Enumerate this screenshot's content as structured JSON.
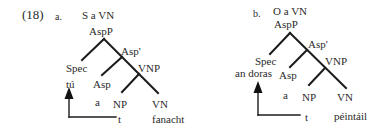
{
  "example_number": "(18)",
  "trees": [
    {
      "id": "a",
      "marker": "a.",
      "caption": "S a VN",
      "nodes": {
        "root": "AspP",
        "bar": "Asp'",
        "spec": "Spec",
        "spec_filler": "tú",
        "head": "Asp",
        "head_word": "a",
        "vnp": "VNP",
        "np": "NP",
        "vn": "VN",
        "vn_word": "fanacht",
        "trace": "t"
      }
    },
    {
      "id": "b",
      "marker": "b.",
      "caption": "O a VN",
      "nodes": {
        "root": "AspP",
        "bar": "Asp'",
        "spec": "Spec",
        "spec_filler": "an doras",
        "head": "Asp",
        "head_word": "a",
        "vnp": "VNP",
        "np": "NP",
        "vn": "VN",
        "vn_word": "péintáil",
        "trace": "t"
      }
    }
  ],
  "icons": {
    "movement_arrow": "up-arrow-icon"
  }
}
